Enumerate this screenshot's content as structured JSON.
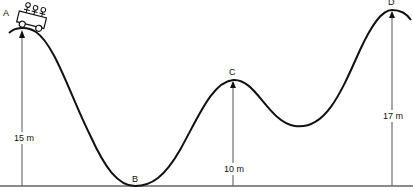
{
  "diagram": {
    "points": {
      "A": {
        "label": "A"
      },
      "B": {
        "label": "B"
      },
      "C": {
        "label": "C"
      },
      "D": {
        "label": "D"
      }
    },
    "heights": {
      "A": "15 m",
      "C": "10 m",
      "D": "17 m"
    },
    "colors": {
      "curve": "#111111",
      "line": "#555555"
    }
  }
}
